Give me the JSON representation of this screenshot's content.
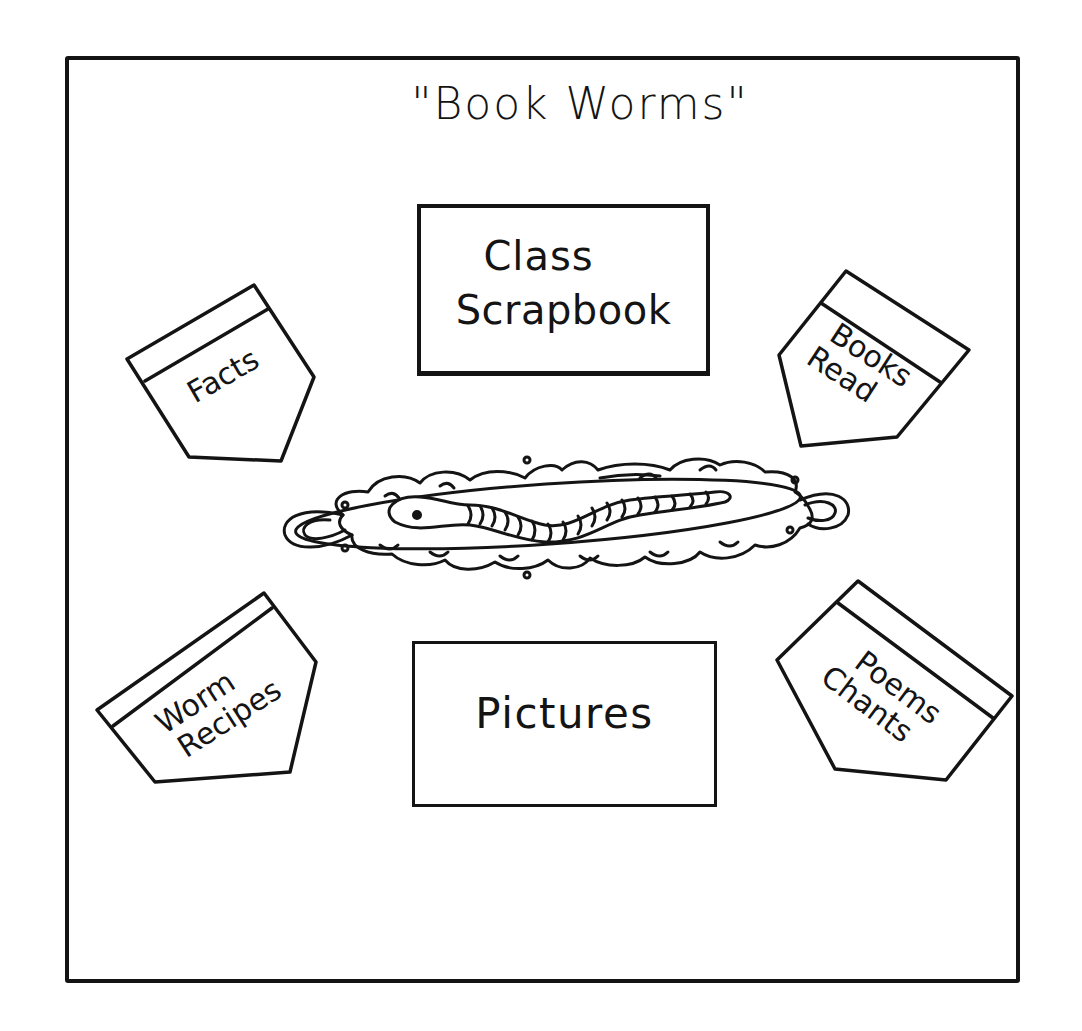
{
  "board": {
    "title": "\"Book Worms\"",
    "center_boxes": {
      "scrapbook": {
        "line1": "Class",
        "line2": "Scrapbook"
      },
      "pictures": {
        "line1": "Pictures"
      }
    },
    "pockets": [
      {
        "id": "facts",
        "line1": "Facts",
        "line2": ""
      },
      {
        "id": "books-read",
        "line1": "Books",
        "line2": "Read"
      },
      {
        "id": "worm-recipes",
        "line1": "Worm",
        "line2": "Recipes"
      },
      {
        "id": "poems-chants",
        "line1": "Poems",
        "line2": "Chants"
      }
    ],
    "centerpiece": "worm-on-platter",
    "colors": {
      "ink": "#141414",
      "paper": "#ffffff"
    }
  }
}
